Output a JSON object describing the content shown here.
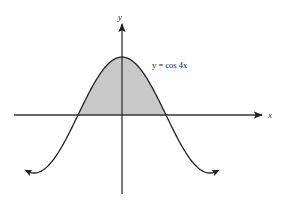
{
  "chart_data": {
    "type": "line",
    "title": "",
    "function": "y = cos 4x",
    "curve_label": "y = cos 4x",
    "xlabel": "x",
    "ylabel": "y",
    "grid": false,
    "legend": "none",
    "shaded_region": {
      "description": "area under y = cos 4x above the x-axis between consecutive zeros",
      "x_from": -0.3927,
      "x_to": 0.3927,
      "fill_color": "#c8c8c8"
    },
    "key_points": [
      {
        "name": "left-zero",
        "x": -0.3927,
        "y": 0
      },
      {
        "name": "maximum",
        "x": 0,
        "y": 1
      },
      {
        "name": "right-zero",
        "x": 0.3927,
        "y": 0
      },
      {
        "name": "left-minimum",
        "x": -0.7854,
        "y": -1
      },
      {
        "name": "right-minimum",
        "x": 0.7854,
        "y": -1
      }
    ],
    "x": [
      -0.85,
      -0.7854,
      -0.589,
      -0.3927,
      -0.196,
      0,
      0.196,
      0.3927,
      0.589,
      0.7854,
      0.85
    ],
    "values": [
      -0.96,
      -1,
      -0.707,
      0,
      0.707,
      1,
      0.707,
      0,
      -0.707,
      -1,
      -0.96
    ],
    "xlim": [
      -1.2,
      1.6
    ],
    "ylim": [
      -1.4,
      1.6
    ],
    "colors": {
      "curve": "#222222",
      "axes": "#333333",
      "fill": "#c8c8c8",
      "background": "#ffffff"
    }
  },
  "labels": {
    "x_axis": "x",
    "y_axis": "y",
    "curve": "y = cos 4x"
  }
}
